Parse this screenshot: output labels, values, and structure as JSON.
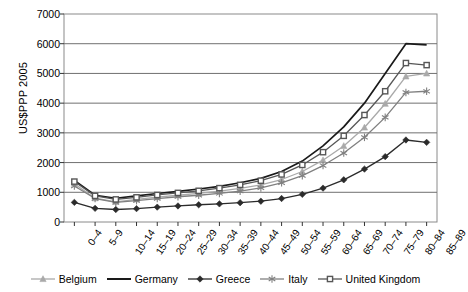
{
  "chart_data": {
    "type": "line",
    "title": "",
    "xlabel": "",
    "ylabel": "US$PPP 2005",
    "ylim": [
      0,
      7000
    ],
    "yticks": [
      0,
      1000,
      2000,
      3000,
      4000,
      5000,
      6000,
      7000
    ],
    "grid": true,
    "legend_position": "bottom",
    "categories": [
      "0–4",
      "5–9",
      "10–14",
      "15–19",
      "20–24",
      "25–29",
      "30–34",
      "35–39",
      "40–44",
      "45–49",
      "50–54",
      "55–59",
      "60–64",
      "65–69",
      "70–74",
      "75–79",
      "80–84",
      "85–89"
    ],
    "series": [
      {
        "name": "Belgium",
        "color": "#a9a9a9",
        "marker": "triangle",
        "values": [
          1290,
          800,
          680,
          760,
          840,
          900,
          960,
          1040,
          1130,
          1250,
          1430,
          1700,
          2080,
          2560,
          3180,
          3980,
          4900,
          5000
        ]
      },
      {
        "name": "Germany",
        "color": "#1a1a1a",
        "marker": "none",
        "values": [
          1400,
          900,
          800,
          880,
          960,
          1030,
          1110,
          1200,
          1320,
          1470,
          1700,
          2050,
          2560,
          3200,
          4000,
          5000,
          6000,
          5960
        ]
      },
      {
        "name": "Greece",
        "color": "#2b2b2b",
        "marker": "diamond",
        "values": [
          660,
          460,
          420,
          450,
          500,
          540,
          580,
          610,
          650,
          700,
          790,
          930,
          1140,
          1420,
          1780,
          2200,
          2760,
          2680
        ]
      },
      {
        "name": "Italy",
        "color": "#808080",
        "marker": "star",
        "values": [
          1210,
          790,
          660,
          720,
          790,
          850,
          900,
          960,
          1040,
          1150,
          1320,
          1560,
          1900,
          2320,
          2850,
          3520,
          4360,
          4400
        ]
      },
      {
        "name": "United Kingdom",
        "color": "#575757",
        "marker": "square",
        "values": [
          1360,
          880,
          760,
          830,
          910,
          980,
          1050,
          1140,
          1250,
          1390,
          1600,
          1920,
          2350,
          2900,
          3600,
          4400,
          5350,
          5280
        ]
      }
    ]
  },
  "legend": {
    "items": [
      {
        "label": "Belgium"
      },
      {
        "label": "Germany"
      },
      {
        "label": "Greece"
      },
      {
        "label": "Italy"
      },
      {
        "label": "United Kingdom"
      }
    ]
  }
}
